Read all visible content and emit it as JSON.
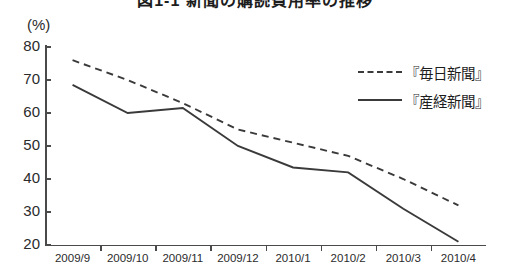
{
  "figure": {
    "title_partial": "図1-1 新聞の購読費用率の推移",
    "unit_label": "(%)"
  },
  "chart_data": {
    "type": "line",
    "title": "図1-1 新聞の購読費用率の推移",
    "xlabel": "",
    "ylabel": "(%)",
    "ylim": [
      20,
      80
    ],
    "yticks": [
      80,
      70,
      60,
      50,
      40,
      30,
      20
    ],
    "grid": false,
    "legend_position": "top-right",
    "categories": [
      "2009/9",
      "2009/10",
      "2009/11",
      "2009/12",
      "2010/1",
      "2010/2",
      "2010/3",
      "2010/4"
    ],
    "series": [
      {
        "name": "『毎日新聞』",
        "style": "dashed",
        "color": "#3a3a3a",
        "values": [
          76,
          70,
          63,
          55,
          51,
          47,
          40,
          32
        ]
      },
      {
        "name": "『産経新聞』",
        "style": "solid",
        "color": "#3a3a3a",
        "values": [
          68.5,
          60,
          61.5,
          50,
          43.5,
          42,
          31,
          21
        ]
      }
    ]
  }
}
